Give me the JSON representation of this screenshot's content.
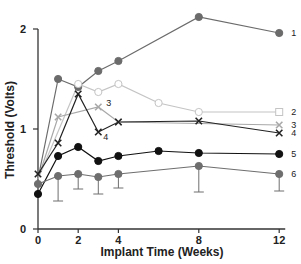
{
  "chart_data": {
    "type": "line",
    "title": "",
    "xlabel": "Implant Time (Weeks)",
    "ylabel": "Threshold (Volts)",
    "xlim": [
      0,
      12.5
    ],
    "ylim": [
      0,
      2.2
    ],
    "xticks": [
      0,
      2,
      4,
      8,
      12
    ],
    "yticks": [
      0,
      1,
      2
    ],
    "grid": false,
    "legend": "inline labels at right end of each series",
    "series": [
      {
        "name": "1",
        "color": "#6b6b6b",
        "marker": "filled-circle",
        "x": [
          0,
          1,
          2,
          3,
          4,
          8,
          12
        ],
        "y": [
          0.5,
          1.5,
          1.42,
          1.58,
          1.68,
          2.12,
          1.96
        ]
      },
      {
        "name": "2",
        "color": "#c4c4c4",
        "marker": "open-circle",
        "end_marker": "open-square",
        "x": [
          0,
          2,
          3,
          4,
          6,
          8,
          12
        ],
        "y": [
          0.5,
          1.45,
          1.37,
          1.45,
          1.26,
          1.17,
          1.17
        ]
      },
      {
        "name": "3",
        "color": "#a8a8a8",
        "marker": "x",
        "x": [
          0,
          1,
          3,
          4,
          12
        ],
        "y": [
          0.5,
          1.12,
          1.22,
          1.07,
          1.04
        ]
      },
      {
        "name": "4",
        "color": "#222222",
        "marker": "x",
        "x": [
          0,
          1,
          2,
          3,
          4,
          8,
          12
        ],
        "y": [
          0.55,
          0.86,
          1.35,
          0.97,
          1.07,
          1.08,
          0.96
        ]
      },
      {
        "name": "5",
        "color": "#111111",
        "marker": "filled-circle",
        "x": [
          0,
          1,
          2,
          3,
          4,
          6,
          8,
          12
        ],
        "y": [
          0.35,
          0.73,
          0.82,
          0.68,
          0.73,
          0.78,
          0.76,
          0.75
        ]
      },
      {
        "name": "6",
        "color": "#6e6e6e",
        "marker": "filled-circle",
        "x": [
          0,
          1,
          2,
          3,
          4,
          8,
          12
        ],
        "y": [
          0.45,
          0.53,
          0.55,
          0.52,
          0.55,
          0.63,
          0.55
        ],
        "error_lower": [
          null,
          0.28,
          0.4,
          0.35,
          0.41,
          0.37,
          0.38
        ]
      }
    ]
  }
}
